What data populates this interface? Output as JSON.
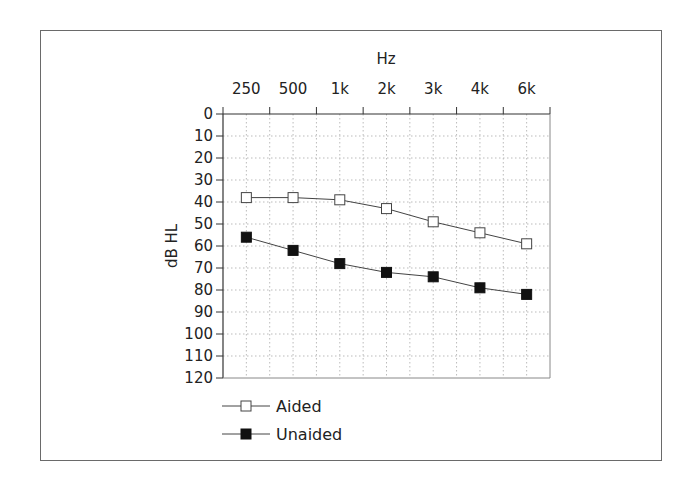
{
  "chart_data": {
    "type": "line",
    "title": "",
    "xlabel": "Hz",
    "ylabel": "dB HL",
    "categories": [
      "250",
      "500",
      "1k",
      "2k",
      "3k",
      "4k",
      "6k"
    ],
    "y_ticks": [
      0,
      10,
      20,
      30,
      40,
      50,
      60,
      70,
      80,
      90,
      100,
      110,
      120
    ],
    "ylim": [
      0,
      120
    ],
    "y_inverted": true,
    "x_axis_position": "top",
    "grid": true,
    "legend_position": "bottom-left",
    "series": [
      {
        "name": "Aided",
        "marker": "open-square",
        "values": [
          38,
          38,
          39,
          43,
          49,
          54,
          59
        ]
      },
      {
        "name": "Unaided",
        "marker": "filled-square",
        "values": [
          56,
          62,
          68,
          72,
          74,
          79,
          82
        ]
      }
    ]
  },
  "legend": {
    "items": [
      {
        "label": "Aided"
      },
      {
        "label": "Unaided"
      }
    ]
  }
}
